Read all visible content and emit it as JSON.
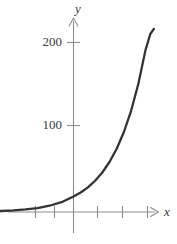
{
  "figure": {
    "name": "exponential-growth-graph",
    "background_color": "#ffffff",
    "width": 177,
    "height": 244
  },
  "chart_data": {
    "type": "line",
    "title": "",
    "subtitle": "",
    "xlabel": "x",
    "ylabel": "y",
    "grid": false,
    "legend": null,
    "annotations": [],
    "axis_style": {
      "arrows": true,
      "axis_color": "#8c8c8c",
      "curve_color": "#333333",
      "origin_visible": true
    },
    "xlim": [
      -5.2,
      4.6
    ],
    "ylim": [
      -28,
      232
    ],
    "y_ticks": [
      {
        "value": 100,
        "label": "100"
      },
      {
        "value": 200,
        "label": "200"
      }
    ],
    "x_ticks": [
      {
        "value": -3,
        "label": ""
      },
      {
        "value": -2,
        "label": ""
      },
      {
        "value": 1,
        "label": ""
      },
      {
        "value": 2,
        "label": ""
      },
      {
        "value": 3,
        "label": ""
      }
    ],
    "series": [
      {
        "name": "exponential-curve",
        "color": "#333333",
        "x": [
          -4.4,
          -4.0,
          -3.5,
          -3.0,
          -2.5,
          -2.0,
          -1.5,
          -1.0,
          -0.5,
          0.0,
          0.3,
          0.6,
          0.9,
          1.2,
          1.5,
          1.8,
          2.1,
          2.4,
          2.7,
          3.0,
          3.2,
          3.35
        ],
        "values": [
          0.4,
          0.5,
          0.8,
          1.2,
          1.9,
          3.0,
          4.7,
          7.4,
          11.6,
          18.2,
          23.0,
          29.1,
          36.9,
          46.6,
          59.0,
          74.6,
          94.4,
          119.4,
          151.0,
          191.0,
          210.0,
          216.0
        ]
      }
    ],
    "axis_labels": {
      "y_axis_symbol": "y",
      "x_axis_symbol": "x"
    }
  },
  "labels": {
    "y_tick_200": "200",
    "y_tick_100": "100",
    "y_axis_symbol": "y",
    "x_axis_symbol": "x"
  }
}
